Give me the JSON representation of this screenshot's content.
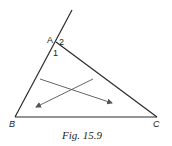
{
  "figure": {
    "caption": "Fig. 15.9",
    "vertices": {
      "A": {
        "label": "A",
        "x": 56,
        "y": 42
      },
      "B": {
        "label": "B",
        "x": 15,
        "y": 117
      },
      "C": {
        "label": "C",
        "x": 157,
        "y": 117
      }
    },
    "angle_labels": {
      "angle1": "1",
      "angle2": "2"
    },
    "extension_end": {
      "x": 72,
      "y": 10
    },
    "arrows": [
      {
        "name": "arrow-1",
        "x1": 40,
        "y1": 79,
        "x2": 112,
        "y2": 103
      },
      {
        "name": "arrow-2",
        "x1": 93,
        "y1": 79,
        "x2": 36,
        "y2": 107
      }
    ],
    "colors": {
      "triangle": "#2a2a2a",
      "arrows": "#555555",
      "background": "#ffffff"
    }
  }
}
